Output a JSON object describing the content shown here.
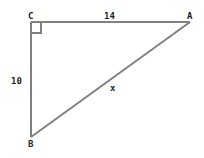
{
  "diagram": {
    "type": "right-triangle",
    "vertices": {
      "C": {
        "label": "C",
        "x": 31,
        "y": 22
      },
      "A": {
        "label": "A",
        "x": 190,
        "y": 22
      },
      "B": {
        "label": "B",
        "x": 31,
        "y": 137
      }
    },
    "sides": {
      "CA": {
        "label": "14"
      },
      "CB": {
        "label": "10"
      },
      "AB": {
        "label": "x"
      }
    },
    "right_angle_at": "C",
    "line_color": "#808080"
  }
}
